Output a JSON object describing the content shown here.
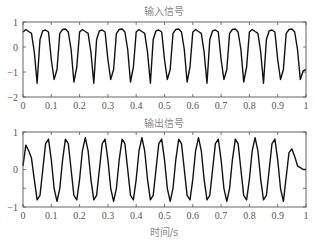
{
  "figure": {
    "width": 316,
    "height": 244,
    "background": "#ffffff",
    "line_color": "#111111",
    "axis_color": "#555555",
    "title_color": "#888888"
  },
  "chart_data": [
    {
      "type": "line",
      "title": "输入信号",
      "xlabel": "",
      "ylabel": "",
      "xlim": [
        0,
        1
      ],
      "ylim": [
        -2,
        1
      ],
      "xticks": [
        0,
        0.1,
        0.2,
        0.3,
        0.4,
        0.5,
        0.6,
        0.7,
        0.8,
        0.9,
        1
      ],
      "xtick_labels": [
        "0",
        "0.1",
        "0.2",
        "0.3",
        "0.4",
        "0.5",
        "0.6",
        "0.7",
        "0.8",
        "0.9",
        "1"
      ],
      "yticks": [
        -2,
        -1,
        0,
        1
      ],
      "ytick_labels": [
        "−2",
        "−1",
        "0",
        "1"
      ],
      "grid": false,
      "box": {
        "left": 23,
        "top": 22,
        "right": 306,
        "bottom": 97
      },
      "sample_interval": 0.01,
      "series": [
        {
          "name": "input",
          "x_start": 0,
          "values": [
            0.6,
            0.7,
            0.62,
            0.55,
            -0.2,
            -1.45,
            0.3,
            0.65,
            0.68,
            0.6,
            -0.5,
            -1.3,
            -0.9,
            0.55,
            0.7,
            0.72,
            0.6,
            -0.1,
            -1.4,
            -0.8,
            0.6,
            0.7,
            0.62,
            0.55,
            -0.2,
            -1.45,
            0.3,
            0.65,
            0.68,
            0.6,
            -0.5,
            -1.3,
            -0.9,
            0.55,
            0.7,
            0.72,
            0.6,
            -0.1,
            -1.4,
            -0.8,
            0.6,
            0.7,
            0.62,
            0.55,
            -0.2,
            -1.45,
            0.3,
            0.65,
            0.68,
            0.6,
            -0.5,
            -1.3,
            -0.9,
            0.55,
            0.7,
            0.72,
            0.6,
            -0.1,
            -1.4,
            -0.8,
            0.6,
            0.7,
            0.62,
            0.55,
            -0.2,
            -1.45,
            0.3,
            0.65,
            0.68,
            0.6,
            -0.5,
            -1.3,
            -0.9,
            0.55,
            0.7,
            0.72,
            0.6,
            -0.1,
            -1.4,
            -0.8,
            0.6,
            0.7,
            0.62,
            0.55,
            -0.2,
            -1.45,
            0.3,
            0.65,
            0.68,
            0.6,
            -0.5,
            -1.3,
            -0.9,
            0.55,
            0.7,
            0.72,
            0.6,
            -0.1,
            -1.3,
            -0.95,
            -0.9
          ]
        }
      ]
    },
    {
      "type": "line",
      "title": "输出信号",
      "xlabel": "时间/s",
      "ylabel": "",
      "xlim": [
        0,
        1
      ],
      "ylim": [
        -1,
        1
      ],
      "xticks": [
        0,
        0.1,
        0.2,
        0.3,
        0.4,
        0.5,
        0.6,
        0.7,
        0.8,
        0.9,
        1
      ],
      "xtick_labels": [
        "0",
        "0.1",
        "0.2",
        "0.3",
        "0.4",
        "0.5",
        "0.6",
        "0.7",
        "0.8",
        "0.9",
        "1"
      ],
      "yticks": [
        -1,
        -0.5,
        0,
        1
      ],
      "ytick_labels": [
        "−1",
        "",
        "0",
        "1"
      ],
      "grid": false,
      "box": {
        "left": 23,
        "top": 132,
        "right": 306,
        "bottom": 207
      },
      "sample_interval": 0.01,
      "series": [
        {
          "name": "output",
          "x_start": 0,
          "values": [
            0.1,
            0.65,
            0.5,
            0.3,
            -0.26,
            -0.81,
            -0.69,
            0.0,
            0.69,
            0.81,
            0.26,
            -0.5,
            -0.85,
            -0.5,
            0.26,
            0.81,
            0.69,
            0.0,
            -0.69,
            -0.81,
            -0.26,
            0.5,
            0.85,
            0.5,
            -0.26,
            -0.81,
            -0.69,
            0.0,
            0.69,
            0.81,
            0.26,
            -0.5,
            -0.85,
            -0.5,
            0.26,
            0.81,
            0.69,
            0.0,
            -0.69,
            -0.81,
            -0.26,
            0.5,
            0.85,
            0.5,
            -0.26,
            -0.81,
            -0.69,
            0.0,
            0.69,
            0.81,
            0.26,
            -0.5,
            -0.85,
            -0.5,
            0.26,
            0.81,
            0.69,
            0.0,
            -0.69,
            -0.81,
            -0.26,
            0.5,
            0.85,
            0.5,
            -0.26,
            -0.81,
            -0.69,
            0.0,
            0.69,
            0.81,
            0.26,
            -0.5,
            -0.85,
            -0.5,
            0.26,
            0.81,
            0.69,
            0.0,
            -0.69,
            -0.81,
            -0.26,
            0.5,
            0.85,
            0.5,
            -0.26,
            -0.81,
            -0.69,
            0.0,
            0.69,
            0.81,
            0.26,
            -0.5,
            -0.85,
            -0.2,
            0.45,
            0.55,
            0.35,
            0.1,
            0.05,
            0.0,
            0.0
          ]
        }
      ]
    }
  ]
}
